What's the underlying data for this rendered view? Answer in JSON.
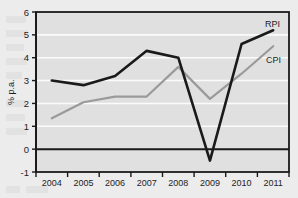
{
  "chart_data": {
    "type": "line",
    "title": "",
    "xlabel": "",
    "ylabel": "% p.a.",
    "categories": [
      "2004",
      "2005",
      "2006",
      "2007",
      "2008",
      "2009",
      "2010",
      "2011"
    ],
    "ylim": [
      -1,
      6
    ],
    "y_ticks": [
      "-1",
      "0",
      "1",
      "2",
      "3",
      "4",
      "5",
      "6"
    ],
    "grid": true,
    "legend_position": "inline-right",
    "series": [
      {
        "name": "RPI",
        "color": "#1a1a1a",
        "values": [
          3.0,
          2.8,
          3.2,
          4.3,
          4.0,
          -0.5,
          4.6,
          5.2
        ]
      },
      {
        "name": "CPI",
        "color": "#9a9a9a",
        "values": [
          1.35,
          2.05,
          2.3,
          2.3,
          3.6,
          2.2,
          3.3,
          4.5
        ]
      }
    ]
  },
  "colors": {
    "page_background": "#ececed",
    "plot_background": "#e0e0e1",
    "gridline": "#fbfbfb",
    "axis": "#1a1a1a",
    "zero_line": "#1a1a1a",
    "rpi": "#1a1a1a",
    "cpi": "#9a9a9a"
  },
  "axis": {
    "y_title": "% p.a.",
    "y_ticks": [
      "6",
      "5",
      "4",
      "3",
      "2",
      "1",
      "0",
      "-1"
    ],
    "x_ticks": [
      "2004",
      "2005",
      "2006",
      "2007",
      "2008",
      "2009",
      "2010",
      "2011"
    ]
  },
  "legend": {
    "rpi_label": "RPI",
    "cpi_label": "CPI"
  }
}
